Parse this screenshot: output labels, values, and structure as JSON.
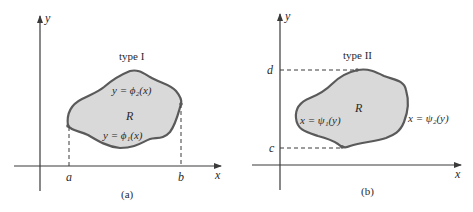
{
  "panels": [
    {
      "id": "a",
      "caption": "(a)",
      "title": "type I",
      "axis_x_label": "x",
      "axis_y_label": "y",
      "region_label": "R",
      "upper_curve": "y = ϕ₂(x)",
      "lower_curve": "y = ϕ₁(x)",
      "bound_left": "a",
      "bound_right": "b"
    },
    {
      "id": "b",
      "caption": "(b)",
      "title": "type II",
      "axis_x_label": "x",
      "axis_y_label": "y",
      "region_label": "R",
      "left_curve": "x = ψ₁(y)",
      "right_curve": "x = ψ₂(y)",
      "bound_top": "d",
      "bound_bottom": "c"
    }
  ],
  "colors": {
    "region_fill": "#d9d9d9",
    "region_stroke": "#5a5a5a",
    "axis": "#3a3a3a"
  }
}
